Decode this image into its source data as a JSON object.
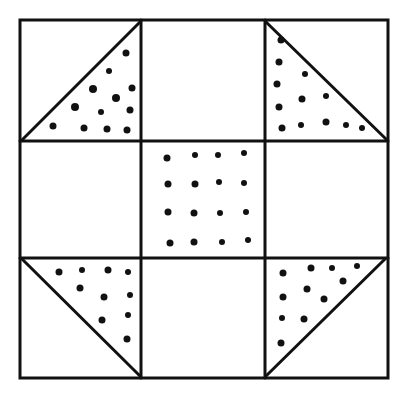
{
  "figure": {
    "grid": "3x3 nine-patch",
    "stroke_color": "#111111",
    "fill_color": "#ffffff",
    "dot_color": "#111111",
    "patches": [
      {
        "row": 0,
        "col": 0,
        "type": "half-square triangle",
        "dotted_half": "lower-right"
      },
      {
        "row": 0,
        "col": 1,
        "type": "plain"
      },
      {
        "row": 0,
        "col": 2,
        "type": "half-square triangle",
        "dotted_half": "lower-left"
      },
      {
        "row": 1,
        "col": 0,
        "type": "plain"
      },
      {
        "row": 1,
        "col": 1,
        "type": "dotted square"
      },
      {
        "row": 1,
        "col": 2,
        "type": "plain"
      },
      {
        "row": 2,
        "col": 0,
        "type": "half-square triangle",
        "dotted_half": "upper-right"
      },
      {
        "row": 2,
        "col": 1,
        "type": "plain"
      },
      {
        "row": 2,
        "col": 2,
        "type": "half-square triangle",
        "dotted_half": "upper-left"
      }
    ]
  }
}
